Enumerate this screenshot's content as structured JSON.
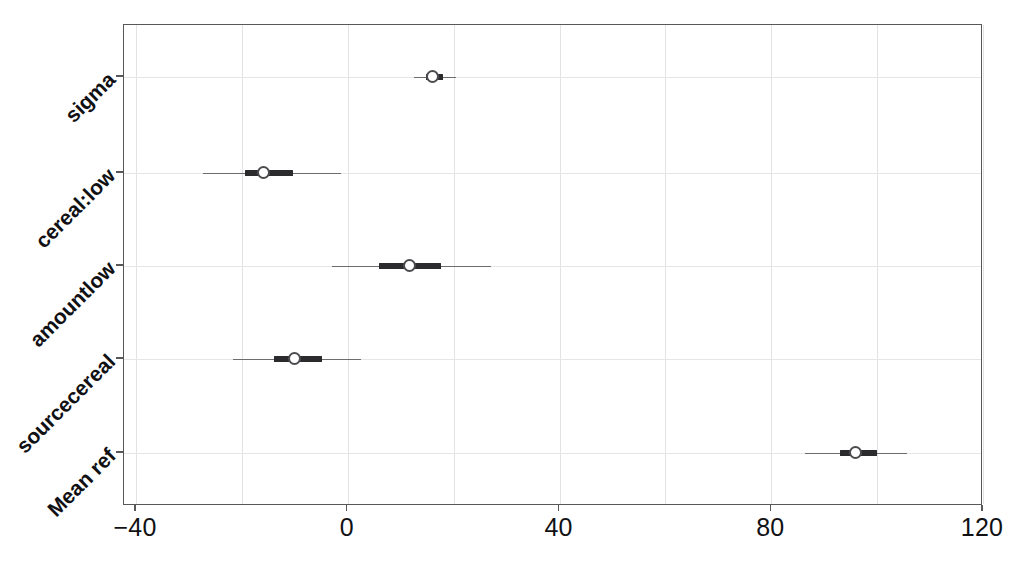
{
  "chart_data": {
    "type": "scatter",
    "title": "",
    "subtitle": "",
    "xlabel": "",
    "ylabel": "",
    "orientation": "horizontal",
    "grid": "light dotted vertical and horizontal gridlines",
    "legend": "none",
    "xlim": [
      -40,
      120
    ],
    "xticks": [
      -40,
      0,
      40,
      80,
      120
    ],
    "xtick_labels": [
      "−40",
      "0",
      "40",
      "80",
      "120"
    ],
    "xgrid_step": 20,
    "categories": [
      "sigma",
      "cereal:low",
      "amountlow",
      "sourcecereal",
      "Mean ref"
    ],
    "series": [
      {
        "name": "posterior interval",
        "points": [
          {
            "category": "sigma",
            "estimate": 16.1,
            "inner_low": 14.8,
            "inner_high": 17.9,
            "outer_low": 12.6,
            "outer_high": 20.5
          },
          {
            "category": "cereal:low",
            "estimate": -16.0,
            "inner_low": -19.4,
            "inner_high": -10.3,
            "outer_low": -27.4,
            "outer_high": -1.3
          },
          {
            "category": "amountlow",
            "estimate": 11.6,
            "inner_low": 5.9,
            "inner_high": 17.6,
            "outer_low": -2.9,
            "outer_high": 27.1
          },
          {
            "category": "sourcecereal",
            "estimate": -10.1,
            "inner_low": -13.9,
            "inner_high": -4.8,
            "outer_low": -21.6,
            "outer_high": 2.5
          },
          {
            "category": "Mean ref",
            "estimate": 96.0,
            "inner_low": 92.9,
            "inner_high": 99.9,
            "outer_low": 86.3,
            "outer_high": 105.6
          }
        ]
      }
    ],
    "marker_style": "open circle",
    "inner_band_style": "thick dark bar",
    "outer_band_style": "thin grey whisker line"
  },
  "colors": {
    "axis": "#58585a",
    "grid": "#e3e3e6",
    "inner_band": "#2b2b2e",
    "outer_band": "#6d6d70",
    "marker_fill": "#ffffff",
    "marker_edge": "#4c4c50",
    "text": "#111114",
    "background": "#ffffff"
  }
}
